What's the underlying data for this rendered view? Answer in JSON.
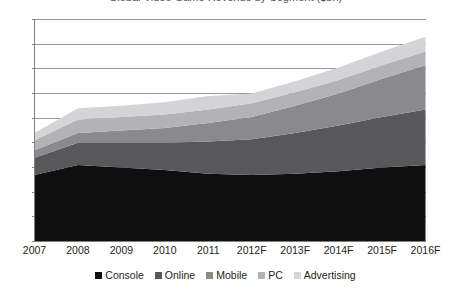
{
  "chart_data": {
    "type": "area",
    "stacked": true,
    "title": "Global Video Game Revenue by Segment ($bn)",
    "xlabel": "",
    "ylabel": "",
    "ylim": [
      0,
      90
    ],
    "ytick_step": 10,
    "grid": "horizontal",
    "legend_position": "bottom",
    "categories": [
      "2007",
      "2008",
      "2009",
      "2010",
      "2011",
      "2012F",
      "2013F",
      "2014F",
      "2015F",
      "2016F"
    ],
    "yticks": [
      "0",
      "10",
      "20",
      "30",
      "40",
      "50",
      "60",
      "70",
      "80",
      "90"
    ],
    "series": [
      {
        "name": "Console",
        "color": "#100f0f",
        "values": [
          27.0,
          31.0,
          30.0,
          29.0,
          27.5,
          27.0,
          27.5,
          28.5,
          30.0,
          31.0
        ]
      },
      {
        "name": "Online",
        "color": "#58585a",
        "values": [
          7.0,
          9.0,
          10.0,
          11.0,
          13.0,
          14.5,
          16.5,
          18.5,
          20.5,
          22.5
        ]
      },
      {
        "name": "Mobile",
        "color": "#8a8a8c",
        "values": [
          3.0,
          4.0,
          5.0,
          6.0,
          7.5,
          9.0,
          11.0,
          13.0,
          15.5,
          18.0
        ]
      },
      {
        "name": "PC",
        "color": "#b3b3b5",
        "values": [
          4.0,
          5.5,
          5.5,
          5.5,
          5.5,
          5.5,
          5.5,
          5.5,
          5.5,
          5.5
        ]
      },
      {
        "name": "Advertising",
        "color": "#d4d4d6",
        "values": [
          3.0,
          4.5,
          4.5,
          5.0,
          5.5,
          4.0,
          4.5,
          5.0,
          5.5,
          6.0
        ]
      }
    ]
  },
  "legend": {
    "items": [
      {
        "label": "Console"
      },
      {
        "label": "Online"
      },
      {
        "label": "Mobile"
      },
      {
        "label": "PC"
      },
      {
        "label": "Advertising"
      }
    ]
  },
  "axis": {
    "line_color": "#7f7f7f",
    "grid_color": "#808080"
  }
}
